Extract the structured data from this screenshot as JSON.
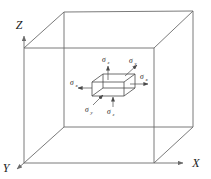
{
  "figure": {
    "type": "diagram",
    "background_color": "#ffffff",
    "line_color": "#6b6b6b",
    "element_line_color": "#4a4a4a",
    "text_color": "#1a1a1a"
  },
  "axes": [
    {
      "id": "z",
      "label": "Z",
      "position": "top-left",
      "direction": "up"
    },
    {
      "id": "y",
      "label": "Y",
      "position": "bottom-left",
      "direction": "down-left"
    },
    {
      "id": "x",
      "label": "X",
      "position": "bottom-right",
      "direction": "right"
    }
  ],
  "outer_box": {
    "name": "bounding-cube",
    "description": "large wireframe rectangular box drawn in oblique projection"
  },
  "stress_element": {
    "name": "stress-element",
    "description": "small rectangular element at the centre of the box with normal stress arrows on each face"
  },
  "stress_labels": [
    {
      "id": "sigma-z-top",
      "symbol": "σ",
      "subscript": "z",
      "face": "top",
      "arrow": "outward-up"
    },
    {
      "id": "sigma-y-upper",
      "symbol": "σ",
      "subscript": "y",
      "face": "back-right",
      "arrow": "outward-up-right"
    },
    {
      "id": "sigma-x-right",
      "symbol": "σ",
      "subscript": "x",
      "face": "right",
      "arrow": "outward-right"
    },
    {
      "id": "sigma-x-left",
      "symbol": "σ",
      "subscript": "x",
      "face": "left",
      "arrow": "outward-left"
    },
    {
      "id": "sigma-y-lower",
      "symbol": "σ",
      "subscript": "y",
      "face": "front-left",
      "arrow": "inward-up-right"
    },
    {
      "id": "sigma-z-bottom",
      "symbol": "σ",
      "subscript": "z",
      "face": "bottom",
      "arrow": "inward-down"
    }
  ]
}
